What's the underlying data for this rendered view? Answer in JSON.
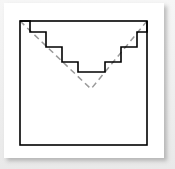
{
  "figure": {
    "background_color": "#eeeeee",
    "card_color": "#ffffff",
    "shadow_color": "#787878",
    "square": {
      "stroke_color": "#000000",
      "stroke_width": 1.6,
      "fill": "none",
      "x": 20,
      "y": 21,
      "width": 127,
      "height": 124
    },
    "staircase": {
      "stroke_color": "#000000",
      "stroke_width": 1.6,
      "fill": "none",
      "step_count_per_side": 4,
      "points": "20,21 30,21 30,32 46,32 46,47 62,47 62,62 78,62 78,72 105,72 105,62 121,62 121,47 137,47 137,32 147,32 147,21"
    },
    "dashed_lines": {
      "stroke_color": "#9a9a9a",
      "stroke_width": 1.5,
      "dash_pattern": "6,4",
      "left_line": {
        "x1": 20,
        "y1": 21,
        "x2": 91,
        "y2": 89
      },
      "right_line": {
        "x1": 147,
        "y1": 21,
        "x2": 91,
        "y2": 89
      }
    }
  }
}
